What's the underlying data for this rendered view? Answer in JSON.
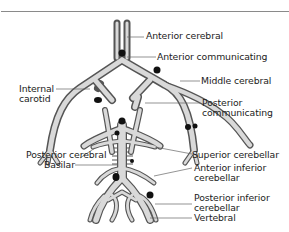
{
  "colors": {
    "vessel_fill": "#d9d9d9",
    "vessel_outline": "#555555",
    "aneurysm": "#111111",
    "leader": "#666666",
    "rule": "#8a8a8a"
  },
  "labels": {
    "anterior_cerebral": "Anterior cerebral",
    "anterior_communicating": "Anterior communicating",
    "middle_cerebral": "Middle cerebral",
    "internal_carotid_1": "Internal",
    "internal_carotid_2": "carotid",
    "posterior_communicating_1": "Posterior",
    "posterior_communicating_2": "communicating",
    "posterior_cerebral": "Posterior cerebral",
    "basilar": "Basilar",
    "superior_cerebellar": "Superior cerebellar",
    "anterior_inferior_cerebellar_1": "Anterior inferior",
    "anterior_inferior_cerebellar_2": "cerebellar",
    "posterior_inferior_cerebellar_1": "Posterior inferior",
    "posterior_inferior_cerebellar_2": "cerebellar",
    "vertebral": "Vertebral"
  }
}
